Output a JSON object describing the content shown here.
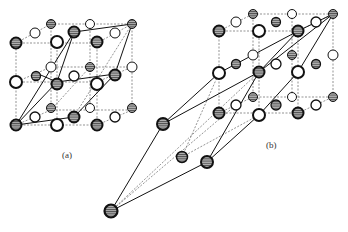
{
  "figure": {
    "type": "crystal-structure-diagram",
    "panels": [
      {
        "id": "a",
        "caption": "(a)"
      },
      {
        "id": "b",
        "caption": "(b)"
      }
    ]
  },
  "legend_implicit": {
    "hatched_atom": "shaded (hatched) atom",
    "open_atom": "open (white) atom"
  },
  "colors": {
    "line": "#111111",
    "dashed": "#555555",
    "hatch_fill": "#7a7a7a",
    "background": "#ffffff"
  }
}
